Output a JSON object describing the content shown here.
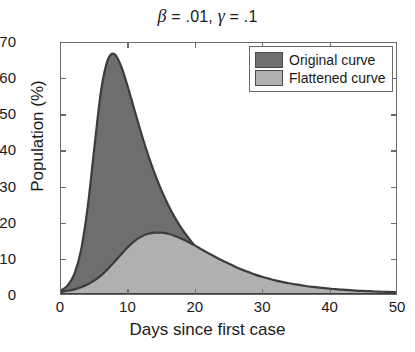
{
  "chart_data": {
    "type": "area",
    "title": "β = .01, γ = .1",
    "title_parts": {
      "beta_symbol": "β",
      "beta_value": "= .01,",
      "gamma_symbol": "γ",
      "gamma_value": "= .1"
    },
    "xlabel": "Days since first case",
    "ylabel": "Population (%)",
    "xlim": [
      0,
      50
    ],
    "ylim": [
      0,
      70
    ],
    "xticks": [
      0,
      10,
      20,
      30,
      40,
      50
    ],
    "yticks": [
      0,
      10,
      20,
      30,
      40,
      50,
      60,
      70
    ],
    "grid": false,
    "legend_position": "top-right",
    "colors": {
      "original": "#6e6e6e",
      "flattened": "#b0b0b0",
      "outline": "#3c3c3c",
      "axis": "#6a6a6a",
      "text": "#1a1a1a"
    },
    "x": [
      0,
      1,
      2,
      3,
      4,
      5,
      6,
      7,
      8,
      9,
      10,
      11,
      12,
      13,
      14,
      15,
      16,
      17,
      18,
      19,
      20,
      21,
      22,
      23,
      24,
      25,
      26,
      27,
      28,
      29,
      30,
      31,
      32,
      33,
      34,
      35,
      36,
      37,
      38,
      39,
      40,
      41,
      42,
      43,
      44,
      45,
      46,
      47,
      48,
      49,
      50
    ],
    "series": [
      {
        "name": "Original curve",
        "color": "#6e6e6e",
        "peak_day": 8.2,
        "peak_value": 66.9,
        "values": [
          1.0,
          2.4,
          5.6,
          12.3,
          24.4,
          41.2,
          56.9,
          65.4,
          66.9,
          63.4,
          57.6,
          51.1,
          44.7,
          38.8,
          33.5,
          28.9,
          24.8,
          21.3,
          18.3,
          15.7,
          13.4,
          11.5,
          9.9,
          8.5,
          7.3,
          6.2,
          5.4,
          4.6,
          3.9,
          3.4,
          2.9,
          2.5,
          2.2,
          1.9,
          1.6,
          1.4,
          1.2,
          1.0,
          0.9,
          0.8,
          0.7,
          0.6,
          0.5,
          0.45,
          0.4,
          0.35,
          0.3,
          0.26,
          0.22,
          0.19,
          0.17
        ]
      },
      {
        "name": "Flattened curve",
        "color": "#b0b0b0",
        "peak_day": 15.5,
        "peak_value": 17.1,
        "values": [
          0.6,
          0.9,
          1.3,
          1.9,
          2.7,
          3.8,
          5.2,
          7.0,
          9.0,
          11.1,
          13.1,
          14.8,
          16.0,
          16.8,
          17.1,
          17.1,
          16.8,
          16.2,
          15.4,
          14.5,
          13.5,
          12.4,
          11.4,
          10.4,
          9.4,
          8.5,
          7.6,
          6.8,
          6.1,
          5.4,
          4.8,
          4.3,
          3.8,
          3.4,
          3.0,
          2.7,
          2.4,
          2.1,
          1.9,
          1.7,
          1.5,
          1.35,
          1.2,
          1.1,
          0.95,
          0.85,
          0.78,
          0.7,
          0.63,
          0.57,
          0.52
        ]
      }
    ]
  },
  "legend": {
    "items": [
      {
        "label": "Original curve",
        "color": "#6e6e6e"
      },
      {
        "label": "Flattened curve",
        "color": "#b0b0b0"
      }
    ]
  }
}
